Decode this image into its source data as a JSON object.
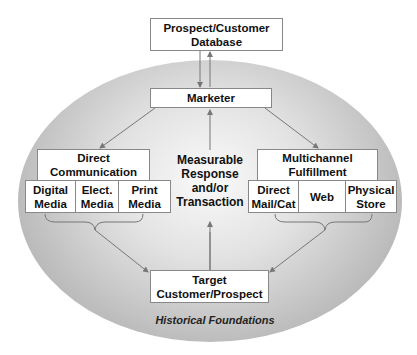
{
  "diagram": {
    "database": "Prospect/Customer Database",
    "marketer": "Marketer",
    "direct_communication": {
      "title": "Direct Communication",
      "channels": [
        "Digital Media",
        "Elect. Media",
        "Print Media"
      ]
    },
    "center": "Measurable Response and/or Transaction",
    "fulfillment": {
      "title": "Multichannel Fulfillment",
      "channels": [
        "Direct Mail/Cat",
        "Web",
        "Physical Store"
      ]
    },
    "target": "Target Customer/Prospect",
    "foundation": "Historical Foundations"
  }
}
